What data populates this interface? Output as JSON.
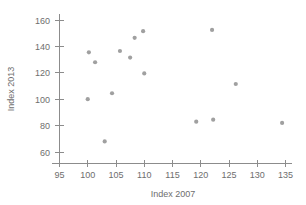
{
  "chart_data": {
    "type": "scatter",
    "title": "",
    "xlabel": "Index 2007",
    "ylabel": "Index 2013",
    "xlim": [
      95,
      137
    ],
    "ylim": [
      55,
      163
    ],
    "xticks": [
      95,
      100,
      105,
      110,
      115,
      120,
      125,
      130,
      135
    ],
    "yticks": [
      60,
      80,
      100,
      120,
      140,
      160
    ],
    "xtick_labels": [
      "95",
      "100",
      "105",
      "110",
      "115",
      "120",
      "125",
      "130",
      "135"
    ],
    "ytick_labels": [
      "60",
      "80",
      "100",
      "120",
      "140",
      "160"
    ],
    "grid": false,
    "legend": false,
    "marker_color": "#a0a0a0",
    "axis_color": "#8c8c8c",
    "text_color": "#6e6e6e",
    "background": "#ffffff",
    "points": [
      {
        "x": 100.0,
        "y": 100.0
      },
      {
        "x": 100.2,
        "y": 135.5
      },
      {
        "x": 101.3,
        "y": 128.0
      },
      {
        "x": 103.0,
        "y": 68.0
      },
      {
        "x": 104.3,
        "y": 104.5
      },
      {
        "x": 105.7,
        "y": 136.5
      },
      {
        "x": 107.5,
        "y": 131.5
      },
      {
        "x": 108.3,
        "y": 146.5
      },
      {
        "x": 109.8,
        "y": 151.5
      },
      {
        "x": 110.0,
        "y": 119.5
      },
      {
        "x": 119.2,
        "y": 83.0
      },
      {
        "x": 122.0,
        "y": 152.5
      },
      {
        "x": 122.2,
        "y": 84.5
      },
      {
        "x": 126.2,
        "y": 111.5
      },
      {
        "x": 134.4,
        "y": 82.0
      }
    ]
  }
}
